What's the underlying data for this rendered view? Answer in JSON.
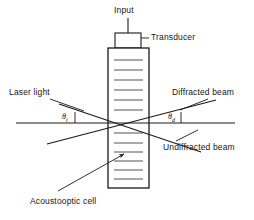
{
  "figure": {
    "type": "schematic-diagram",
    "background_color": "#ffffff",
    "line_color": "#1a1a1a",
    "stripe_color": "#555555",
    "width": 254,
    "height": 220
  },
  "labels": {
    "input": "Input",
    "transducer": "Transducer",
    "laser_light": "Laser light",
    "diffracted_beam": "Diffracted beam",
    "undiffracted_beam": "Undiffracted beam",
    "acoustooptic_cell": "Acoustooptic cell",
    "angle_incident": "θ",
    "angle_incident_sub": "i",
    "angle_diffracted": "θ",
    "angle_diffracted_sub": "d"
  },
  "geometry": {
    "cell": {
      "x": 108,
      "y": 48,
      "width": 41,
      "height": 140
    },
    "transducer_box": {
      "x": 115,
      "y": 33,
      "width": 26,
      "height": 15
    },
    "input_line": {
      "x": 128,
      "y1": 18,
      "y2": 33
    },
    "axis_line": {
      "x1": 16,
      "x2": 235,
      "y": 123
    },
    "crossing_point": {
      "x": 128,
      "y": 123
    },
    "stripe_count_upper": 8,
    "stripe_count_lower": 8
  },
  "beams": {
    "incident": {
      "from_x": 60,
      "from_y": 104,
      "to_x": 200,
      "to_y": 152
    },
    "diffracted": {
      "from_x": 48,
      "from_y": 143,
      "to_x": 215,
      "to_y": 100
    }
  },
  "leaders": {
    "laser_light": {
      "x1": 52,
      "y1": 100,
      "x2": 86,
      "y2": 112
    },
    "diffracted_beam": {
      "x1": 178,
      "y1": 108,
      "x2": 206,
      "y2": 98
    },
    "undiffracted_beam": {
      "x1": 176,
      "y1": 140,
      "x2": 196,
      "y2": 130
    },
    "acoustooptic_cell": {
      "x1": 62,
      "y1": 190,
      "x2": 120,
      "y2": 157
    },
    "transducer": {
      "x1": 141,
      "y1": 40,
      "x2": 148,
      "y2": 40
    }
  }
}
